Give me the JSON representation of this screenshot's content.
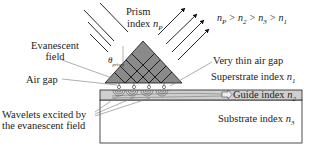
{
  "labels": {
    "prism_line1": "Prism",
    "prism_line2": "index ",
    "prism_index": "n",
    "prism_sub": "P",
    "relation": "nP > n2 > n3 > n1",
    "evanescent_line1": "Evanescent",
    "evanescent_line2": "field",
    "theta": "θ",
    "theta_sub": "prism",
    "air_gap": "Air gap",
    "thin_gap": "Very thin air gap",
    "superstrate": "Superstrate index ",
    "superstrate_sub": "1",
    "guide": "Guide index ",
    "guide_sub": "2",
    "substrate": "Substrate index ",
    "substrate_sub": "3",
    "wavelets_line1": "Wavelets excited by",
    "wavelets_line2": "the evanescent field",
    "n": "n"
  },
  "colors": {
    "prism_fill": "#8a8a8a",
    "guide_fill": "#cfcfcf",
    "line": "#111111",
    "leader": "#777777"
  }
}
